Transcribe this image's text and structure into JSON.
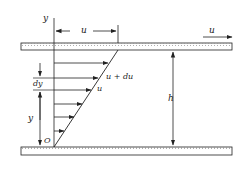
{
  "diagram": {
    "type": "couette-flow-velocity-profile",
    "colors": {
      "stroke": "#222222",
      "plate_fill": "#ffffff",
      "hatch": "#555555"
    },
    "labels": {
      "y_axis": "y",
      "top_velocity_dim": "u",
      "plate_velocity": "u",
      "u_plus_du": "u + du",
      "u_local": "u",
      "dy": "dy",
      "y_height": "y",
      "origin": "O",
      "gap_height": "h"
    }
  }
}
